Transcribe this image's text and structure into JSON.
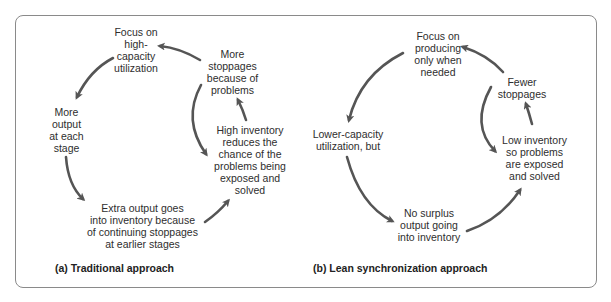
{
  "panels": [
    {
      "caption": "(a) Traditional approach",
      "nodes": [
        {
          "id": "focus",
          "text": "Focus on\nhigh-\ncapacity\nutilization"
        },
        {
          "id": "more-stoppages",
          "text": "More\nstoppages\nbecause of\nproblems"
        },
        {
          "id": "more-output",
          "text": "More\noutput\nat each\nstage"
        },
        {
          "id": "high-inventory",
          "text": "High inventory\nreduces the\nchance of the\nproblems being\nexposed and\nsolved"
        },
        {
          "id": "extra-output",
          "text": "Extra output goes\ninto inventory because\nof continuing stoppages\nat earlier stages"
        }
      ]
    },
    {
      "caption": "(b) Lean synchronization approach",
      "nodes": [
        {
          "id": "focus",
          "text": "Focus on\nproducing\nonly when\nneeded"
        },
        {
          "id": "fewer-stoppages",
          "text": "Fewer\nstoppages"
        },
        {
          "id": "lower-capacity",
          "text": "Lower-capacity\nutilization, but"
        },
        {
          "id": "low-inventory",
          "text": "Low inventory\nso problems\nare exposed\nand solved"
        },
        {
          "id": "no-surplus",
          "text": "No surplus\noutput going\ninto inventory"
        }
      ]
    }
  ],
  "colors": {
    "arrow": "#555555",
    "border": "#8a8a8a",
    "text": "#2e2e2e"
  }
}
